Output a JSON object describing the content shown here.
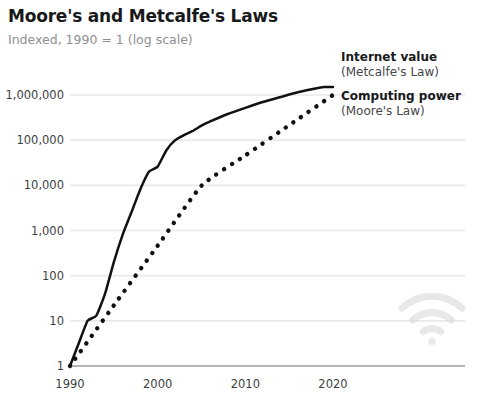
{
  "header": {
    "title": "Moore's and Metcalfe's Laws",
    "subtitle": "Indexed, 1990 = 1 (log scale)"
  },
  "watermark": {
    "icon_name": "wifi-icon",
    "color": "#d4d6d8"
  },
  "colors": {
    "title": "#18191b",
    "subtitle": "#8d9095",
    "axis_text": "#3c3f43",
    "gridline": "#e8e9ea",
    "axis_line": "#9a9da1",
    "series": "#111111"
  },
  "chart_data": {
    "type": "line",
    "title": "Moore's and Metcalfe's Laws",
    "subtitle": "Indexed, 1990 = 1 (log scale)",
    "xlabel": "",
    "ylabel": "",
    "scale": "log",
    "grid": true,
    "legend_position": "inline-right-endpoint",
    "xlim": [
      1990,
      2020
    ],
    "ylim": [
      1,
      1000000
    ],
    "x_ticks": [
      1990,
      2000,
      2010,
      2020
    ],
    "x_tick_labels": [
      "1990",
      "2000",
      "2010",
      "2020"
    ],
    "y_ticks": [
      1,
      10,
      100,
      1000,
      10000,
      100000,
      1000000
    ],
    "y_tick_labels": [
      "1",
      "10",
      "100",
      "1,000",
      "10,000",
      "100,000",
      "1,000,000"
    ],
    "series": [
      {
        "name": "Internet value",
        "sublabel": "(Metcalfe's Law)",
        "style": "solid",
        "color": "#111111",
        "x": [
          1990,
          1991,
          1992,
          1993,
          1994,
          1995,
          1996,
          1997,
          1998,
          1999,
          2000,
          2001,
          2002,
          2003,
          2004,
          2005,
          2006,
          2008,
          2010,
          2012,
          2014,
          2016,
          2018,
          2019,
          2020
        ],
        "values": [
          1,
          3.2,
          10,
          13,
          40,
          200,
          800,
          2500,
          8000,
          20000,
          26000,
          60000,
          100000,
          130000,
          160000,
          210000,
          260000,
          380000,
          520000,
          700000,
          900000,
          1150000,
          1400000,
          1500000,
          1500000
        ]
      },
      {
        "name": "Computing power",
        "sublabel": "(Moore's Law)",
        "style": "dotted",
        "color": "#111111",
        "x": [
          1990,
          1995,
          2000,
          2005,
          2010,
          2015,
          2020
        ],
        "values": [
          1,
          22,
          460,
          9800,
          46000,
          215000,
          1000000
        ]
      }
    ]
  }
}
